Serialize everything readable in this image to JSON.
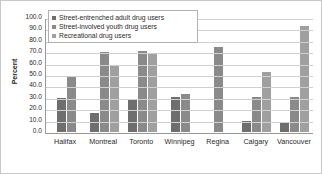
{
  "chart_data": {
    "type": "bar",
    "title": "",
    "xlabel": "",
    "ylabel": "Percent",
    "ylim": [
      0,
      100
    ],
    "ytick_step": 10,
    "ytick_labels": [
      "100.0",
      "90.0",
      "80.0",
      "70.0",
      "60.0",
      "50.0",
      "40.0",
      "30.0",
      "20.0",
      "10.0",
      "0.0"
    ],
    "grid": true,
    "legend_position": "top-left-inside",
    "categories": [
      "Halifax",
      "Montreal",
      "Toronto",
      "Winnipeg",
      "Regina",
      "Calgary",
      "Vancouver"
    ],
    "series": [
      {
        "name": "Street-entrenched adult drug users",
        "color": "#6e6e6e",
        "values": [
          30.0,
          17.0,
          28.0,
          31.0,
          null,
          10.0,
          8.0
        ]
      },
      {
        "name": "Street-involved youth drug users",
        "color": "#8a8a8a",
        "values": [
          49.0,
          70.0,
          71.0,
          33.0,
          75.0,
          31.0,
          31.0
        ]
      },
      {
        "name": "Recreational drug users",
        "color": "#a0a0a0",
        "values": [
          null,
          59.0,
          68.0,
          null,
          null,
          53.0,
          93.0
        ]
      }
    ]
  }
}
